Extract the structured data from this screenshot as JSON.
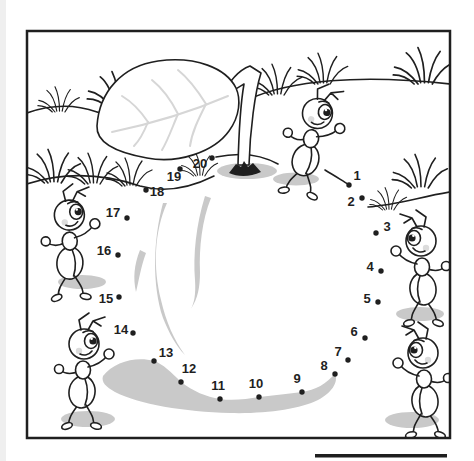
{
  "colors": {
    "line": "#1f1f1f",
    "shade": "#c9c9c9",
    "vein": "#d6d6d6",
    "blush": "#dcdcdc",
    "paper": "#ffffff",
    "page_edge": "#efefef"
  },
  "dots": {
    "count": 20,
    "items": [
      {
        "n": "1",
        "x": 349,
        "y": 185,
        "lx": 357,
        "ly": 177
      },
      {
        "n": "2",
        "x": 362,
        "y": 198,
        "lx": 351,
        "ly": 203
      },
      {
        "n": "3",
        "x": 376,
        "y": 233,
        "lx": 387,
        "ly": 228
      },
      {
        "n": "4",
        "x": 381,
        "y": 271,
        "lx": 370,
        "ly": 268
      },
      {
        "n": "5",
        "x": 378,
        "y": 302,
        "lx": 367,
        "ly": 300
      },
      {
        "n": "6",
        "x": 365,
        "y": 338,
        "lx": 354,
        "ly": 333
      },
      {
        "n": "7",
        "x": 348,
        "y": 360,
        "lx": 338,
        "ly": 353
      },
      {
        "n": "8",
        "x": 335,
        "y": 374,
        "lx": 324,
        "ly": 367
      },
      {
        "n": "9",
        "x": 302,
        "y": 392,
        "lx": 297,
        "ly": 380
      },
      {
        "n": "10",
        "x": 259,
        "y": 397,
        "lx": 256,
        "ly": 385
      },
      {
        "n": "11",
        "x": 220,
        "y": 399,
        "lx": 218,
        "ly": 387
      },
      {
        "n": "12",
        "x": 181,
        "y": 382,
        "lx": 189,
        "ly": 370
      },
      {
        "n": "13",
        "x": 154,
        "y": 361,
        "lx": 166,
        "ly": 354
      },
      {
        "n": "14",
        "x": 133,
        "y": 333,
        "lx": 121,
        "ly": 331
      },
      {
        "n": "15",
        "x": 119,
        "y": 297,
        "lx": 106,
        "ly": 300
      },
      {
        "n": "16",
        "x": 118,
        "y": 255,
        "lx": 104,
        "ly": 252
      },
      {
        "n": "17",
        "x": 127,
        "y": 218,
        "lx": 113,
        "ly": 214
      },
      {
        "n": "18",
        "x": 146,
        "y": 190,
        "lx": 157,
        "ly": 193
      },
      {
        "n": "19",
        "x": 180,
        "y": 169,
        "lx": 174,
        "ly": 178
      },
      {
        "n": "20",
        "x": 212,
        "y": 158,
        "lx": 200,
        "ly": 165
      }
    ]
  }
}
